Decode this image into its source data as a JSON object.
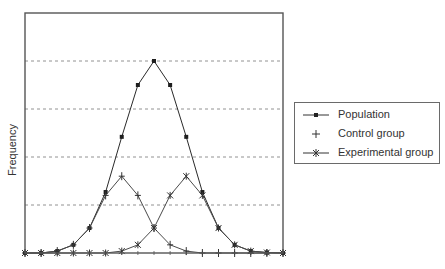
{
  "chart_data": {
    "type": "line",
    "title": "",
    "xlabel": "",
    "ylabel": "Frequency",
    "x": [
      0,
      1,
      2,
      3,
      4,
      5,
      6,
      7,
      8,
      9,
      10,
      11,
      12,
      13,
      14,
      15,
      16
    ],
    "ylim": [
      0,
      5
    ],
    "grid": {
      "horizontal_dashed": [
        1,
        2,
        3,
        4
      ],
      "vertical": false
    },
    "x_tick_labels": [],
    "y_tick_labels": [],
    "legend_position": "right",
    "series": [
      {
        "name": "Population",
        "marker": "square",
        "color": "#2a2a2a",
        "values": [
          0,
          0,
          0.04,
          0.17,
          0.52,
          1.27,
          2.42,
          3.5,
          4.0,
          3.5,
          2.42,
          1.27,
          0.52,
          0.17,
          0.04,
          0.01,
          0
        ]
      },
      {
        "name": "Control group",
        "marker": "plus",
        "color": "#4a4a4a",
        "values": [
          0,
          0,
          0.04,
          0.17,
          0.52,
          1.2,
          1.6,
          1.2,
          0.52,
          0.17,
          0.04,
          0,
          0,
          0,
          0,
          0,
          0
        ]
      },
      {
        "name": "Experimental group",
        "marker": "asterisk",
        "color": "#4a4a4a",
        "values": [
          0,
          0,
          0,
          0,
          0,
          0,
          0.04,
          0.17,
          0.52,
          1.2,
          1.6,
          1.2,
          0.52,
          0.17,
          0.04,
          0.01,
          0
        ]
      }
    ]
  },
  "legend": {
    "items": [
      {
        "label": "Population"
      },
      {
        "label": "Control group"
      },
      {
        "label": "Experimental group"
      }
    ]
  }
}
